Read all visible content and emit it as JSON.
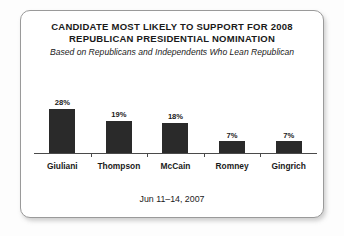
{
  "card": {
    "title_line1": "CANDIDATE MOST LIKELY TO SUPPORT FOR 2008",
    "title_line2": "REPUBLICAN PRESIDENTIAL NOMINATION",
    "subtitle": "Based on Republicans and Independents Who Lean Republican",
    "footer_date": "Jun 11–14, 2007"
  },
  "colors": {
    "bar_fill": "#2a2a2a",
    "axis": "#4a4a4a",
    "text": "#1a1a1a",
    "card_background": "#ffffff",
    "card_border": "#9a9a9a",
    "page_background": "#fdfdfd"
  },
  "chart_data": {
    "type": "bar",
    "title": "CANDIDATE MOST LIKELY TO SUPPORT FOR 2008 REPUBLICAN PRESIDENTIAL NOMINATION",
    "subtitle": "Based on Republicans and Independents Who Lean Republican",
    "categories": [
      "Giuliani",
      "Thompson",
      "McCain",
      "Romney",
      "Gingrich"
    ],
    "values": [
      28,
      19,
      18,
      7,
      7
    ],
    "value_labels": [
      "28%",
      "19%",
      "18%",
      "7%",
      "7%"
    ],
    "xlabel": "",
    "ylabel": "",
    "ylim": [
      0,
      32
    ],
    "grid": false,
    "legend": "none",
    "annotation": "Jun 11–14, 2007"
  }
}
